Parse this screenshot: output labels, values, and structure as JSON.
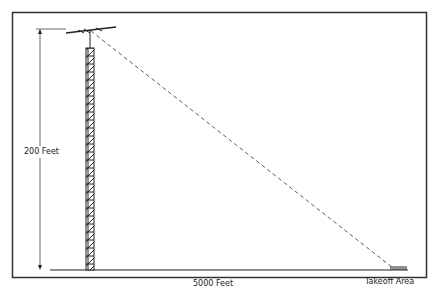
{
  "diagram": {
    "height_label": "200 Feet",
    "distance_label": "5000 Feet",
    "endpoint_label": "Takeoff Area",
    "elements": [
      "tower",
      "antenna",
      "sight-line",
      "height-dimension",
      "ground-line"
    ],
    "colors": {
      "line": "#222222",
      "frame": "#333333",
      "background": "#ffffff"
    }
  }
}
